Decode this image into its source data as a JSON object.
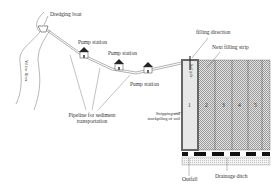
{
  "labels": {
    "dredging_boat": "Dredging boat",
    "river": "Yellow River",
    "pump_station_1": "Pump station",
    "pump_station_2": "Pump station",
    "pump_station_3": "Pump station",
    "pipeline": "Pipeline for sediment transportation",
    "filling_direction": "filling direction",
    "next_filling_strip": "Next filling strip",
    "soil_pile": "Soil pile",
    "stripping": "Stripping and stockpiling of soil",
    "outfall": "Outfall",
    "drainage_ditch": "Drainage ditch"
  },
  "strips": [
    "1",
    "2",
    "3",
    "4",
    "5"
  ],
  "colors": {
    "line": "#555555",
    "roof": "#222222",
    "strip_fill": "#cfcfcf",
    "border": "#666666",
    "ditch_block": "#111111"
  }
}
